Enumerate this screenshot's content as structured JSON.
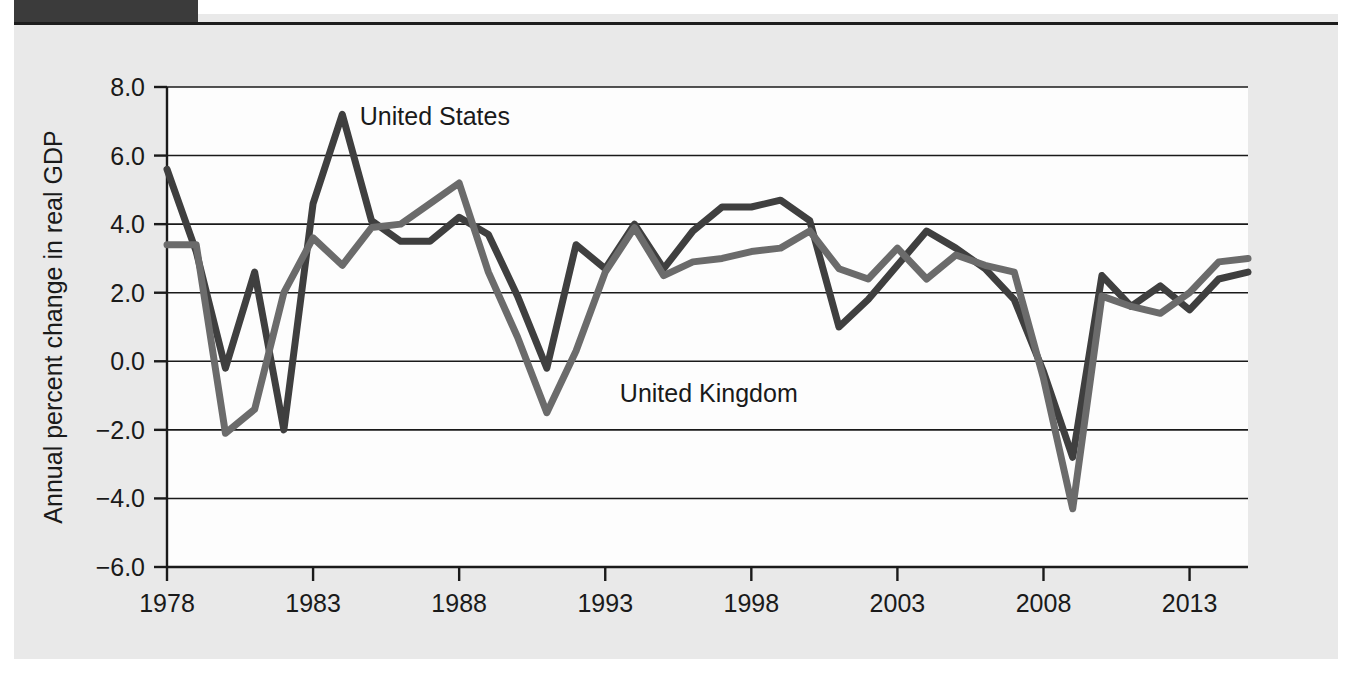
{
  "figure": {
    "background_color": "#e9e9e9",
    "plot_background_color": "#fdfdfd",
    "tab_color": "#3b3b3b"
  },
  "chart_data": {
    "type": "line",
    "title": "",
    "xlabel": "",
    "ylabel": "Annual percent change in real GDP",
    "xlim": [
      1978,
      2015
    ],
    "ylim": [
      -6.0,
      8.0
    ],
    "grid": true,
    "legend_position": "inline-annotation",
    "x_tick_labels": [
      "1978",
      "1983",
      "1988",
      "1993",
      "1998",
      "2003",
      "2008",
      "2013"
    ],
    "x_ticks": [
      1978,
      1983,
      1988,
      1993,
      1998,
      2003,
      2008,
      2013
    ],
    "y_tick_labels": [
      "8.0",
      "6.0",
      "4.0",
      "2.0",
      "0.0",
      "-2.0",
      "-4.0",
      "-6.0"
    ],
    "y_ticks": [
      8.0,
      6.0,
      4.0,
      2.0,
      0.0,
      -2.0,
      -4.0,
      -6.0
    ],
    "x": [
      1978,
      1979,
      1980,
      1981,
      1982,
      1983,
      1984,
      1985,
      1986,
      1987,
      1988,
      1989,
      1990,
      1991,
      1992,
      1993,
      1994,
      1995,
      1996,
      1997,
      1998,
      1999,
      2000,
      2001,
      2002,
      2003,
      2004,
      2005,
      2006,
      2007,
      2008,
      2009,
      2010,
      2011,
      2012,
      2013,
      2014,
      2015
    ],
    "series": [
      {
        "name": "United States",
        "color": "#3f3f3f",
        "label_x": 1984.6,
        "label_y": 6.9,
        "values": [
          5.6,
          3.2,
          -0.2,
          2.6,
          -2.0,
          4.6,
          7.2,
          4.1,
          3.5,
          3.5,
          4.2,
          3.7,
          1.9,
          -0.2,
          3.4,
          2.7,
          4.0,
          2.7,
          3.8,
          4.5,
          4.5,
          4.7,
          4.1,
          1.0,
          1.8,
          2.8,
          3.8,
          3.3,
          2.7,
          1.8,
          -0.3,
          -2.8,
          2.5,
          1.6,
          2.2,
          1.5,
          2.4,
          2.6
        ]
      },
      {
        "name": "United Kingdom",
        "color": "#6b6b6b",
        "label_x": 1993.5,
        "label_y": -1.2,
        "values": [
          3.4,
          3.4,
          -2.1,
          -1.4,
          2.0,
          3.6,
          2.8,
          3.9,
          4.0,
          4.6,
          5.2,
          2.6,
          0.7,
          -1.5,
          0.3,
          2.6,
          3.9,
          2.5,
          2.9,
          3.0,
          3.2,
          3.3,
          3.8,
          2.7,
          2.4,
          3.3,
          2.4,
          3.1,
          2.8,
          2.6,
          -0.5,
          -4.3,
          1.9,
          1.6,
          1.4,
          2.0,
          2.9,
          3.0
        ]
      }
    ]
  }
}
